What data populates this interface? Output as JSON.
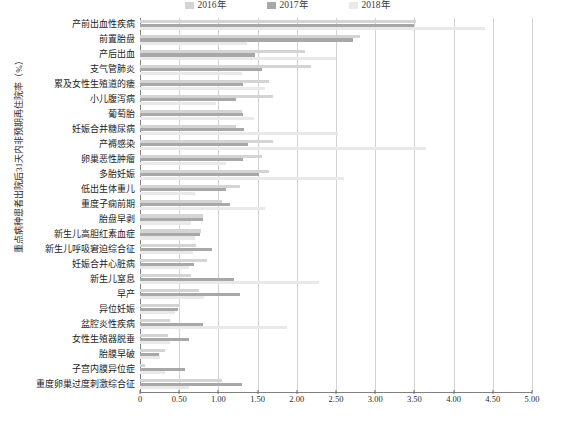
{
  "chart_data": {
    "type": "bar",
    "orientation": "horizontal",
    "title": "",
    "xlabel": "",
    "ylabel": "重点病种患者出院后31天内非预期再住院率（%）",
    "xlim": [
      0,
      5.0
    ],
    "xticks": [
      "0",
      "0.50",
      "1.00",
      "1.50",
      "2.00",
      "2.50",
      "3.00",
      "3.50",
      "4.00",
      "4.50",
      "5.00"
    ],
    "xtick_values": [
      0,
      0.5,
      1.0,
      1.5,
      2.0,
      2.5,
      3.0,
      3.5,
      4.0,
      4.5,
      5.0
    ],
    "grid": true,
    "grid_axis": "x",
    "legend_position": "top-center",
    "categories": [
      "产前出血性疾病",
      "前置胎盘",
      "产后出血",
      "支气管肺炎",
      "累及女性生殖道的瘘",
      "小儿腹泻病",
      "葡萄胎",
      "妊娠合并糖尿病",
      "产褥感染",
      "卵巢恶性肿瘤",
      "多胎妊娠",
      "低出生体重儿",
      "重度子痫前期",
      "胎盘早剥",
      "新生儿高胆红素血症",
      "新生儿呼吸窘迫综合征",
      "妊娠合并心脏病",
      "新生儿窒息",
      "早产",
      "异位妊娠",
      "盆腔炎性疾病",
      "女性生殖器脱垂",
      "胎膜早破",
      "子宫内膜异位症",
      "重度卵巢过度刺激综合征"
    ],
    "series": [
      {
        "name": "2016年",
        "color": "#d4d4d4",
        "values": [
          3.52,
          2.8,
          2.1,
          2.18,
          1.65,
          1.7,
          1.3,
          1.22,
          1.7,
          1.55,
          1.65,
          1.28,
          1.05,
          0.8,
          0.78,
          0.72,
          0.85,
          0.65,
          0.75,
          0.5,
          0.38,
          0.36,
          0.32,
          0.07,
          1.05
        ]
      },
      {
        "name": "2017年",
        "color": "#a8a8a8",
        "values": [
          3.5,
          2.72,
          1.47,
          1.55,
          1.32,
          1.22,
          1.32,
          1.33,
          1.38,
          1.32,
          1.52,
          1.1,
          1.15,
          0.8,
          0.77,
          0.92,
          0.69,
          1.2,
          1.28,
          0.48,
          0.8,
          0.63,
          0.24,
          0.58,
          1.3
        ]
      },
      {
        "name": "2018年",
        "color": "#e9e9e9",
        "values": [
          4.4,
          1.37,
          2.5,
          1.3,
          1.6,
          0.97,
          1.45,
          2.52,
          3.65,
          1.1,
          2.6,
          0.7,
          1.6,
          0.65,
          0.7,
          0.68,
          0.62,
          2.28,
          0.82,
          0.45,
          1.88,
          0.38,
          0.25,
          0.32,
          0.62
        ]
      }
    ]
  },
  "legend": {
    "items": [
      {
        "label": "2016年",
        "color": "#d4d4d4"
      },
      {
        "label": "2017年",
        "color": "#a8a8a8"
      },
      {
        "label": "2018年",
        "color": "#e9e9e9"
      }
    ]
  },
  "axis": {
    "y_title": "重点病种患者出院后31天内非预期再住院率（%）"
  }
}
